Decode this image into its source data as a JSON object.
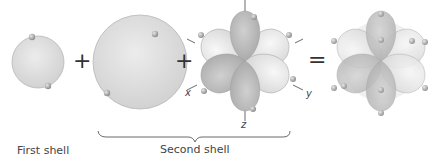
{
  "labels": {
    "first_shell": "First shell",
    "second_shell": "Second shell"
  },
  "axes": {
    "x": "x",
    "y": "y",
    "z": "z"
  },
  "operators": {
    "plus1": "+",
    "plus2": "+",
    "equals": "="
  },
  "colors": {
    "sphere_fill": "#dcdcdc",
    "sphere_edge": "#b5b5b5",
    "lobe_dark": "#bdbdbd",
    "lobe_light": "#e8e8e8",
    "electron": "#a9a9a9",
    "text": "#444444"
  }
}
